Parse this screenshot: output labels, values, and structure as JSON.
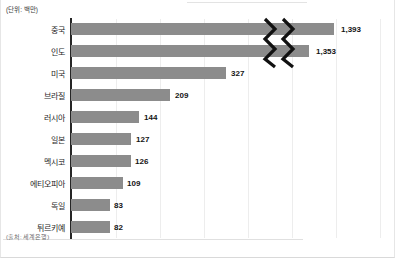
{
  "notes": {
    "unit": "(단위: 백만)",
    "source": "(출처: 세계은행)"
  },
  "colors": {
    "bar": "#8c8c8c",
    "axis": "#262626",
    "grid": "#ededed",
    "text": "#1f1f1f"
  },
  "chart_data": {
    "type": "bar",
    "orientation": "horizontal",
    "title": "",
    "subtitle": "",
    "xlabel": "",
    "ylabel": "",
    "unit_note": "(단위: 백만)",
    "source_note": "(출처: 세계은행)",
    "grid": true,
    "legend": "none",
    "axis_break": true,
    "axis_break_note": "Top two bars (중국, 인도) are cut by a double zigzag break mark",
    "categories": [
      "중국",
      "인도",
      "미국",
      "브라질",
      "러시아",
      "일본",
      "멕시코",
      "에티오피아",
      "독일",
      "튀르키예"
    ],
    "values": [
      1393,
      1353,
      327,
      209,
      144,
      127,
      126,
      109,
      83,
      82
    ],
    "value_labels": [
      "1,393",
      "1,353",
      "327",
      "209",
      "144",
      "127",
      "126",
      "109",
      "83",
      "82"
    ],
    "xlim": [
      0,
      1500
    ],
    "bars": [
      {
        "category": "중국",
        "value": 1393,
        "label": "1,393",
        "bar_width": 263,
        "label_x": 340,
        "broken": true
      },
      {
        "category": "인도",
        "value": 1353,
        "label": "1,353",
        "bar_width": 238,
        "label_x": 315,
        "broken": true
      },
      {
        "category": "미국",
        "value": 327,
        "label": "327",
        "bar_width": 155,
        "label_x": 230,
        "broken": false
      },
      {
        "category": "브라질",
        "value": 209,
        "label": "209",
        "bar_width": 99,
        "label_x": 174,
        "broken": false
      },
      {
        "category": "러시아",
        "value": 144,
        "label": "144",
        "bar_width": 68,
        "label_x": 143,
        "broken": false
      },
      {
        "category": "일본",
        "value": 127,
        "label": "127",
        "bar_width": 60,
        "label_x": 135,
        "broken": false
      },
      {
        "category": "멕시코",
        "value": 126,
        "label": "126",
        "bar_width": 60,
        "label_x": 134,
        "broken": false
      },
      {
        "category": "에티오피아",
        "value": 109,
        "label": "109",
        "bar_width": 52,
        "label_x": 126,
        "broken": false
      },
      {
        "category": "독일",
        "value": 83,
        "label": "83",
        "bar_width": 39,
        "label_x": 113,
        "broken": false
      },
      {
        "category": "튀르키예",
        "value": 82,
        "label": "82",
        "bar_width": 39,
        "label_x": 113,
        "broken": false
      }
    ],
    "gridline_x": [
      115,
      159,
      203,
      247,
      291,
      335,
      379
    ]
  }
}
